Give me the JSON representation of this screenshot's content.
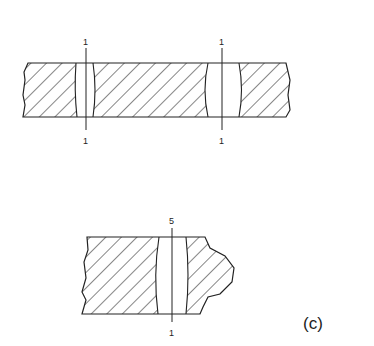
{
  "figure": {
    "panel_label": "(c)",
    "top_section": {
      "weld_1": {
        "label_top": "1",
        "label_bottom": "1"
      },
      "weld_2": {
        "label_top": "1",
        "label_bottom": "1"
      }
    },
    "bottom_section": {
      "weld": {
        "label_top": "5",
        "label_bottom": "1"
      }
    },
    "colors": {
      "stroke": "#222222",
      "background": "#ffffff"
    }
  }
}
